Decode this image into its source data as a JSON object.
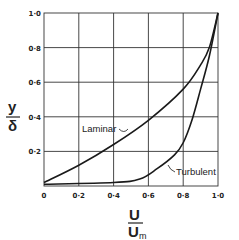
{
  "chart_data": {
    "type": "line",
    "title": "",
    "xlabel": "U / U_m",
    "ylabel": "y / δ",
    "xlim": [
      0,
      1.0
    ],
    "ylim": [
      0,
      1.0
    ],
    "grid": true,
    "x_ticks": [
      "0",
      "0·2",
      "0·4",
      "0·6",
      "0·8",
      "1·0"
    ],
    "y_ticks": [
      "0·2",
      "0·4",
      "0·6",
      "0·8",
      "1·0"
    ],
    "series": [
      {
        "name": "Laminar",
        "x": [
          0,
          0.2,
          0.4,
          0.6,
          0.8,
          0.9,
          0.95,
          1.0
        ],
        "y": [
          0.02,
          0.12,
          0.24,
          0.38,
          0.56,
          0.7,
          0.8,
          1.0
        ]
      },
      {
        "name": "Turbulent",
        "x": [
          0,
          0.4,
          0.55,
          0.65,
          0.75,
          0.8,
          0.85,
          0.9,
          0.95,
          1.0
        ],
        "y": [
          0.01,
          0.02,
          0.04,
          0.1,
          0.18,
          0.25,
          0.38,
          0.56,
          0.75,
          1.0
        ]
      }
    ],
    "annotations": [
      "Laminar",
      "Turbulent"
    ]
  },
  "labels": {
    "x_num": "U",
    "x_den": "U",
    "x_den_sub": "m",
    "y_num": "y",
    "y_den": "δ",
    "laminar": "Laminar",
    "turbulent": "Turbulent"
  }
}
